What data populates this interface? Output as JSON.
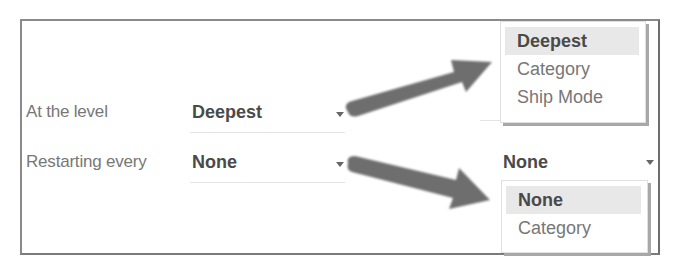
{
  "form": {
    "level": {
      "label": "At the level",
      "value": "Deepest"
    },
    "restart": {
      "label": "Restarting every",
      "value": "None"
    }
  },
  "level_dropdown": {
    "options": [
      {
        "label": "Deepest",
        "selected": true
      },
      {
        "label": "Category",
        "selected": false
      },
      {
        "label": "Ship Mode",
        "selected": false
      }
    ]
  },
  "restart_dropdown": {
    "current_value": "None",
    "options": [
      {
        "label": "None",
        "selected": true
      },
      {
        "label": "Category",
        "selected": false
      }
    ]
  },
  "annotation_arrows": {
    "color": "#6e6e6e",
    "count": 2
  }
}
